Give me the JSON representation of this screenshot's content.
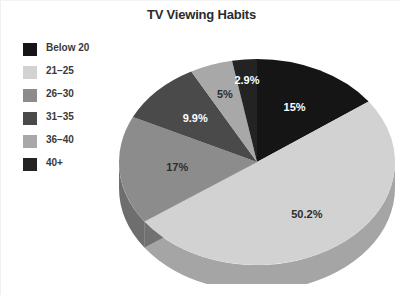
{
  "chart_title": "TV Viewing Habits",
  "legend": {
    "items": [
      {
        "label": "Below 20",
        "color": "#151515"
      },
      {
        "label": "21–25",
        "color": "#d2d2d2"
      },
      {
        "label": "26–30",
        "color": "#8c8c8c"
      },
      {
        "label": "31–35",
        "color": "#4a4a4a"
      },
      {
        "label": "36–40",
        "color": "#a8a8a8"
      },
      {
        "label": "40+",
        "color": "#232323"
      }
    ]
  },
  "chart_data": {
    "type": "pie",
    "title": "TV Viewing Habits",
    "xlabel": "",
    "ylabel": "",
    "grid": false,
    "legend_position": "left",
    "three_d": true,
    "start_angle_deg": 0,
    "direction": "clockwise",
    "categories": [
      "Below 20",
      "21–25",
      "26–30",
      "31–35",
      "36–40",
      "40+"
    ],
    "values": [
      15,
      50.2,
      17,
      9.9,
      5,
      2.9
    ],
    "labels": [
      "15%",
      "50.2%",
      "17%",
      "9.9%",
      "5%",
      "2.9%"
    ],
    "colors": [
      "#151515",
      "#d2d2d2",
      "#8c8c8c",
      "#4a4a4a",
      "#a8a8a8",
      "#232323"
    ],
    "label_colors": [
      "#ffffff",
      "#2d2d2d",
      "#2d2d2d",
      "#ffffff",
      "#2d2d2d",
      "#ffffff"
    ],
    "slices": [
      {
        "category": "Below 20",
        "value": 15,
        "label": "15%",
        "color": "#151515",
        "side_color": "#0d0d0d",
        "label_color": "#ffffff"
      },
      {
        "category": "21–25",
        "value": 50.2,
        "label": "50.2%",
        "color": "#d2d2d2",
        "side_color": "#a5a5a5",
        "label_color": "#2d2d2d"
      },
      {
        "category": "26–30",
        "value": 17,
        "label": "17%",
        "color": "#8c8c8c",
        "side_color": "#6e6e6e",
        "label_color": "#2d2d2d"
      },
      {
        "category": "31–35",
        "value": 9.9,
        "label": "9.9%",
        "color": "#4a4a4a",
        "side_color": "#363636",
        "label_color": "#ffffff"
      },
      {
        "category": "36–40",
        "value": 5,
        "label": "5%",
        "color": "#a8a8a8",
        "side_color": "#828282",
        "label_color": "#2d2d2d"
      },
      {
        "category": "40+",
        "value": 2.9,
        "label": "2.9%",
        "color": "#232323",
        "side_color": "#161616",
        "label_color": "#ffffff"
      }
    ]
  }
}
